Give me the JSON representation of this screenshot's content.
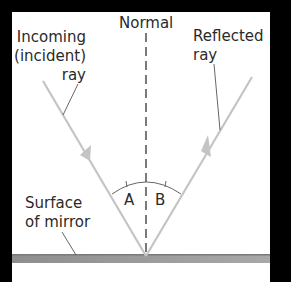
{
  "diagram": {
    "type": "law-of-reflection",
    "labels": {
      "normal": "Normal",
      "incident_line1": "Incoming",
      "incident_line2": "(incident)",
      "incident_line3": "ray",
      "reflected_line1": "Reflected",
      "reflected_line2": "ray",
      "mirror_line1": "Surface",
      "mirror_line2": "of mirror",
      "angle_incidence": "A",
      "angle_reflection": "B"
    },
    "colors": {
      "background": "#000000",
      "panel": "#ffffff",
      "ray": "#c4c4c4",
      "normal_line": "#333333",
      "mirror": "#9a9a9a",
      "text": "#2a2a2a",
      "leader": "#555555"
    }
  }
}
